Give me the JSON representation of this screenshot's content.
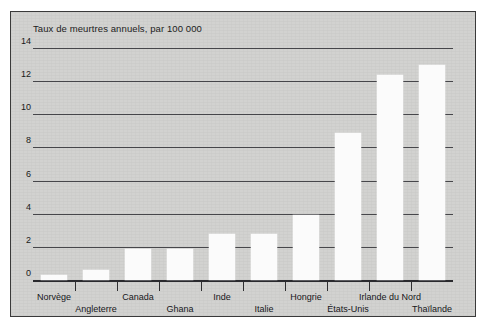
{
  "chart_data": {
    "type": "bar",
    "title": "Taux de meurtres annuels, par 100 000",
    "xlabel": "",
    "ylabel": "",
    "ylim": [
      0,
      14
    ],
    "yticks": [
      0,
      2,
      4,
      6,
      8,
      10,
      12,
      14
    ],
    "ytick_labels": [
      "0",
      "2",
      "4",
      "6",
      "8",
      "10",
      "12",
      "14"
    ],
    "grid": "horizontal",
    "legend": "none",
    "categories": [
      "Norvège",
      "Angleterre",
      "Canada",
      "Ghana",
      "Inde",
      "Italie",
      "Hongrie",
      "États-Unis",
      "Irlande du Nord",
      "Thaïlande"
    ],
    "values": [
      0.3,
      0.6,
      1.85,
      1.85,
      2.8,
      2.8,
      3.9,
      8.9,
      12.4,
      13.0
    ],
    "bar_color": "#fbfbfb",
    "panel_color": "#d2d2d0",
    "axis_color": "#2e2e30",
    "label_rows": [
      1,
      2,
      1,
      2,
      1,
      2,
      1,
      2,
      1,
      2
    ]
  }
}
